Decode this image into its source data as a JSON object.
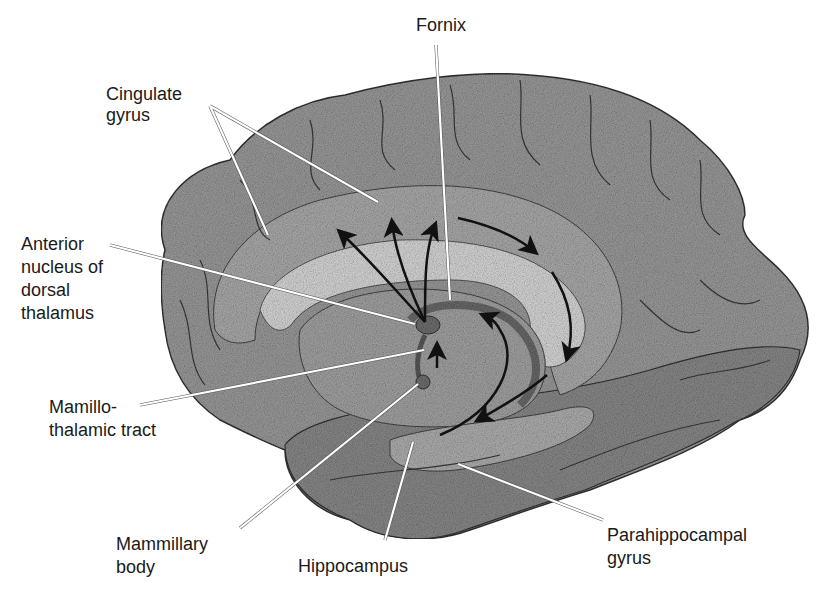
{
  "diagram": {
    "colors": {
      "background": "#ffffff",
      "cortex": "#9a9a9a",
      "cortex_light": "#b8b8b8",
      "corpus_callosum": "#d8d8d8",
      "thalamus": "#a6a6a6",
      "deep_structures": "#7a7a7a",
      "sulci": "#3a3a3a",
      "arrow": "#111111",
      "leader_line": "#ffffff",
      "label_text": "#1a1a1a"
    },
    "labels": {
      "fornix": {
        "lines": [
          "Fornix"
        ]
      },
      "cingulate_gyrus": {
        "lines": [
          "Cingulate",
          "gyrus"
        ]
      },
      "anterior_nucleus": {
        "lines": [
          "Anterior",
          "nucleus of",
          "dorsal",
          "thalamus"
        ]
      },
      "mamillothalamic_tract": {
        "lines": [
          "Mamillo-",
          "thalamic tract"
        ]
      },
      "mammillary_body": {
        "lines": [
          "Mammillary",
          "body"
        ]
      },
      "hippocampus": {
        "lines": [
          "Hippocampus"
        ]
      },
      "parahippocampal_gyrus": {
        "lines": [
          "Parahippocampal",
          "gyrus"
        ]
      }
    }
  }
}
